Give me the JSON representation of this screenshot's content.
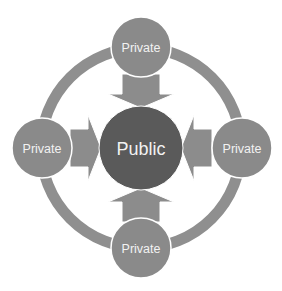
{
  "diagram": {
    "center": {
      "label": "Public",
      "color": "#5a5a5a"
    },
    "nodes": [
      {
        "id": "top",
        "label": "Private"
      },
      {
        "id": "left",
        "label": "Private"
      },
      {
        "id": "right",
        "label": "Private"
      },
      {
        "id": "bottom",
        "label": "Private"
      }
    ],
    "colors": {
      "ring": "#8f8f8f",
      "node": "#8a8a8a",
      "arrow": "#8c8c8c",
      "outline": "#ffffff"
    }
  }
}
